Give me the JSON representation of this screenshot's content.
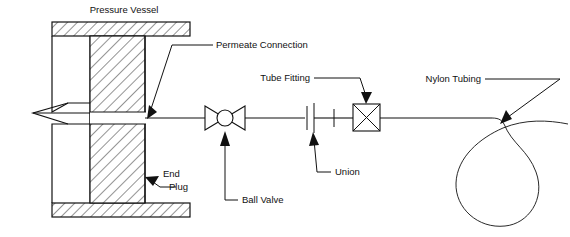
{
  "diagram": {
    "title_label": "Pressure Vessel",
    "background_color": "#ffffff",
    "line_color": "#111111",
    "labels": {
      "pressure_vessel": "Pressure Vessel",
      "permeate_connection": "Permeate Connection",
      "tube_fitting": "Tube Fitting",
      "nylon_tubing": "Nylon Tubing",
      "union": "Union",
      "ball_valve": "Ball Valve",
      "end_plug_line1": "End",
      "end_plug_line2": "Plug"
    },
    "components": [
      {
        "name": "pressure-vessel",
        "label": "Pressure Vessel",
        "type": "sectioned-vessel",
        "has_hatching": true
      },
      {
        "name": "end-plug",
        "label": "End Plug",
        "type": "hatched-block",
        "has_hatching": true
      },
      {
        "name": "permeate-connection",
        "label": "Permeate Connection",
        "type": "port"
      },
      {
        "name": "ball-valve",
        "label": "Ball Valve",
        "type": "bowtie-with-circle"
      },
      {
        "name": "union",
        "label": "Union",
        "type": "triple-bar"
      },
      {
        "name": "tube-fitting",
        "label": "Tube Fitting",
        "type": "square-with-x"
      },
      {
        "name": "nylon-tubing",
        "label": "Nylon Tubing",
        "type": "coiled-loop"
      }
    ]
  }
}
